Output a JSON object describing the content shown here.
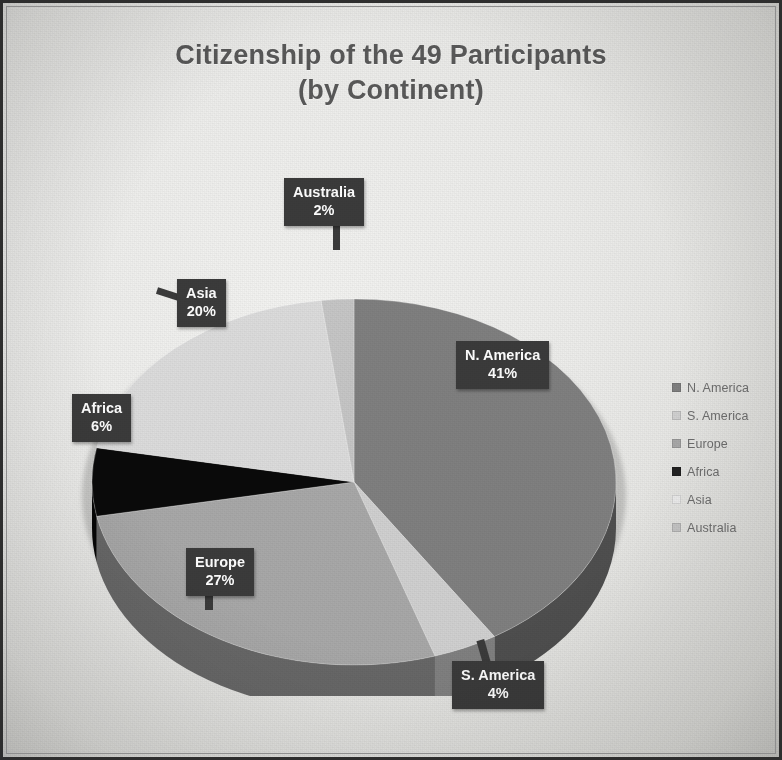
{
  "chart_data": {
    "type": "pie",
    "title": "Citizenship of the 49 Participants (by Continent)",
    "title_line1": "Citizenship of the 49 Participants",
    "title_line2": "(by Continent)",
    "total_participants": 49,
    "unit": "%",
    "categories": [
      "N. America",
      "S. America",
      "Europe",
      "Africa",
      "Asia",
      "Australia"
    ],
    "values": [
      41,
      4,
      27,
      6,
      20,
      2
    ],
    "labels": [
      "41%",
      "4%",
      "27%",
      "6%",
      "20%",
      "2%"
    ],
    "colors": [
      "#808080",
      "#d0d0d0",
      "#a8a8a8",
      "#0a0a0a",
      "#dcdcdc",
      "#c6c6c6"
    ],
    "legend_position": "right",
    "grid": false,
    "three_d": true
  },
  "title": {
    "line1": "Citizenship of the 49 Participants",
    "line2": "(by Continent)",
    "color": "#595959"
  },
  "legend": {
    "items": [
      {
        "label": "N. America",
        "color": "#808080"
      },
      {
        "label": "S. America",
        "color": "#d0d0d0"
      },
      {
        "label": "Europe",
        "color": "#a8a8a8"
      },
      {
        "label": "Africa",
        "color": "#222222"
      },
      {
        "label": "Asia",
        "color": "#ececec"
      },
      {
        "label": "Australia",
        "color": "#c6c6c6"
      }
    ]
  },
  "callouts": {
    "n_america": {
      "name": "N. America",
      "value": "41%"
    },
    "s_america": {
      "name": "S. America",
      "value": "4%"
    },
    "europe": {
      "name": "Europe",
      "value": "27%"
    },
    "africa": {
      "name": "Africa",
      "value": "6%"
    },
    "asia": {
      "name": "Asia",
      "value": "20%"
    },
    "australia": {
      "name": "Australia",
      "value": "2%"
    }
  },
  "theme": {
    "paper": "#ececea",
    "frame": "#2e2e2e",
    "callout_bg": "#3b3b3b",
    "callout_fg": "#ffffff",
    "legend_text": "#6f6f6f"
  }
}
